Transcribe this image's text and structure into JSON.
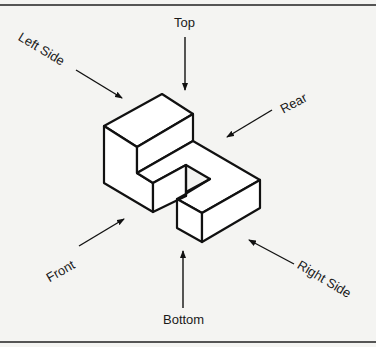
{
  "figure": {
    "type": "isometric-view-directions",
    "labels": {
      "top": "Top",
      "bottom": "Bottom",
      "front": "Front",
      "rear": "Rear",
      "left_side": "Left Side",
      "right_side": "Right Side"
    },
    "colors": {
      "background": "#f4f4f2",
      "line": "#111111",
      "rule": "#555555"
    }
  }
}
